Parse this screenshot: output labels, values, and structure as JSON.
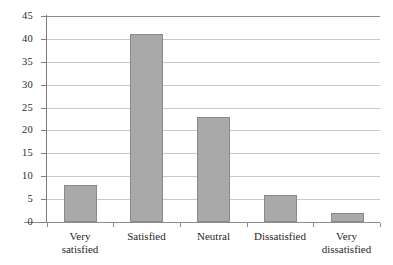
{
  "chart_data": {
    "type": "bar",
    "title": "",
    "subtitle": "",
    "xlabel": "",
    "ylabel": "",
    "categories": [
      "Very satisfied",
      "Satisfied",
      "Neutral",
      "Dissatisfied",
      "Very dissatisfied"
    ],
    "category_lines": [
      [
        "Very",
        "satisfied"
      ],
      [
        "Satisfied",
        ""
      ],
      [
        "Neutral",
        ""
      ],
      [
        "Dissatisfied",
        ""
      ],
      [
        "Very",
        "dissatisfied"
      ]
    ],
    "values": [
      8,
      41,
      23,
      6,
      2
    ],
    "ylim": [
      0,
      45
    ],
    "ytick_labels": [
      "0",
      "5",
      "10",
      "15",
      "20",
      "25",
      "30",
      "35",
      "40",
      "45"
    ],
    "ytick_values": [
      0,
      5,
      10,
      15,
      20,
      25,
      30,
      35,
      40,
      45
    ],
    "grid": true,
    "legend": false,
    "legend_position": "none",
    "colors": {
      "bar_fill": "#a9a9a9",
      "bar_border": "#8a8a8a",
      "gridline": "#c9c9c9",
      "axis": "#8d8d8d",
      "text": "#1f1f1f",
      "background": "#ffffff"
    }
  }
}
